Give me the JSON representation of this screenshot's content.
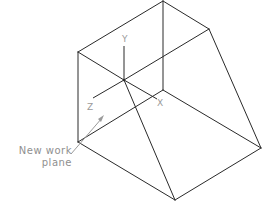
{
  "diagram": {
    "type": "isometric wireframe solid with UCS axes",
    "axes": {
      "x_label": "X",
      "y_label": "Y",
      "z_label": "Z"
    },
    "callout": {
      "line1": "New work",
      "line2": "plane"
    },
    "colors": {
      "edges": "#2a2a2a",
      "annotation": "#9a9a9a",
      "background": "#ffffff"
    }
  }
}
